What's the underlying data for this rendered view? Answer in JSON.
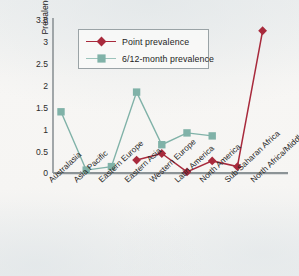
{
  "chart_data": {
    "type": "line",
    "title": "",
    "xlabel": "",
    "ylabel": "Prevalence (%)",
    "ylim": [
      0,
      3.5
    ],
    "yticks": [
      "0",
      "0.5",
      "1",
      "1.5",
      "2",
      "2.5",
      "3",
      "3.5"
    ],
    "ytick_values": [
      0,
      0.5,
      1,
      1.5,
      2,
      2.5,
      3,
      3.5
    ],
    "grid": false,
    "legend_position": "top-center",
    "categories": [
      "Australasia",
      "Asia Pacific",
      "Eastern Europe",
      "Eastern Asia",
      "Western Europe",
      "Latin America",
      "North America",
      "Sub-Saharan Africa",
      "North Africa/Middle East"
    ],
    "series": [
      {
        "name": "Point prevalence",
        "color": "#a82a3c",
        "marker": "diamond",
        "values": [
          null,
          null,
          null,
          0.3,
          0.45,
          0.03,
          0.28,
          0.15,
          3.25
        ]
      },
      {
        "name": "6/12-month prevalence",
        "color": "#80b2a8",
        "marker": "square",
        "values": [
          1.4,
          0.07,
          0.15,
          1.85,
          0.65,
          0.92,
          0.85,
          null,
          null
        ]
      }
    ]
  },
  "colors": {
    "point_prevalence": "#a82a3c",
    "month_prevalence": "#80b2a8",
    "axis": "#8c9396",
    "text": "#222222",
    "background": "#f4f3f1"
  }
}
